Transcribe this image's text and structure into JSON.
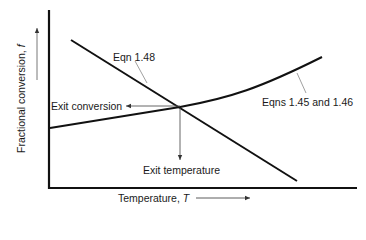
{
  "diagram": {
    "type": "graph-schematic",
    "x_axis": {
      "label": "Temperature, ",
      "symbol": "T"
    },
    "y_axis": {
      "label": "Fractional conversion, ",
      "symbol": "f"
    },
    "curves": [
      {
        "id": "eqn-1-48",
        "label": "Eqn 1.48",
        "shape": "straight line, decreasing"
      },
      {
        "id": "eqns-1-45-1-46",
        "label": "Eqns 1.45 and 1.46",
        "shape": "curve, increasing"
      }
    ],
    "annotations": {
      "exit_conversion": "Exit conversion",
      "exit_temperature": "Exit temperature"
    },
    "colors": {
      "line": "#111111",
      "leader": "#777777",
      "background": "#ffffff"
    }
  }
}
